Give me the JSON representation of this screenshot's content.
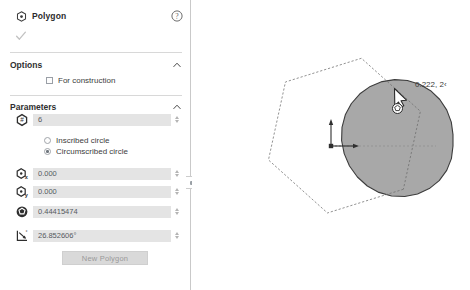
{
  "panel": {
    "title": "Polygon",
    "title_icon": "polygon-center-icon",
    "help_icon": "help-circle-icon",
    "accept_icon": "checkmark-icon",
    "sections": [
      {
        "id": "options",
        "title": "Options",
        "caret": "chevron-up-icon",
        "checkbox": {
          "label": "For construction",
          "checked": false
        }
      },
      {
        "id": "parameters",
        "title": "Parameters",
        "caret": "chevron-up-icon"
      }
    ],
    "parameters": {
      "sides": {
        "icon": "polygon-sides-icon",
        "value": "6"
      },
      "center_x": {
        "icon": "polygon-center-x-icon",
        "value": "0.000"
      },
      "center_y": {
        "icon": "polygon-center-y-icon",
        "value": "0.000"
      },
      "radius": {
        "icon": "polygon-radius-icon",
        "value": "0.44415474"
      },
      "angle": {
        "icon": "polygon-angle-icon",
        "value": "26.852606°"
      }
    },
    "circle_mode": {
      "selected": "circumscribed",
      "options": [
        {
          "id": "inscribed",
          "label": "Inscribed circle",
          "checked": false
        },
        {
          "id": "circumscribed",
          "label": "Circumscribed circle",
          "checked": true
        }
      ]
    },
    "new_polygon_button": "New Polygon",
    "collapse_handle_icon": "panel-collapse-icon"
  },
  "canvas": {
    "coordinate_readout": "0.222, 2‹",
    "cursor_icon": "polygon-draw-cursor",
    "origin_marker_icon": "origin-axes-icon",
    "shapes": {
      "circumscribed_circle": {
        "fill": "#a8a8a8",
        "stroke": "#3c3c3c",
        "center": [
          139,
          146
        ],
        "radius": 122
      },
      "hexagon": {
        "stroke": "#6f6f6f",
        "center": [
          139,
          146
        ],
        "radius": 122,
        "sides": 6,
        "rotation_deg": 26.852606
      },
      "radius_line": {
        "stroke": "#8a8a8a",
        "from": [
          139,
          146
        ],
        "to": [
          248,
          92
        ]
      }
    }
  },
  "colors": {
    "panel_bg": "#ffffff",
    "field_bg": "#e4e4e4",
    "shape_fill": "#a8a8a8",
    "shape_stroke": "#3c3c3c",
    "button_bg": "#d9d9d9",
    "text": "#3b3b3b"
  }
}
